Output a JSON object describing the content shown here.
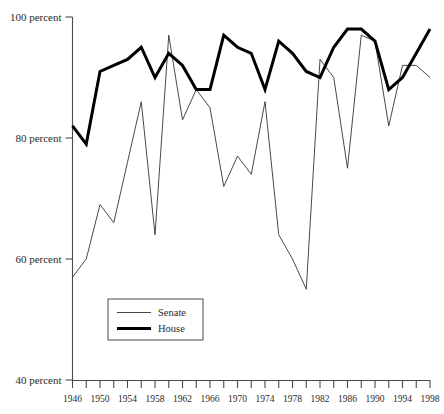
{
  "chart_data": {
    "type": "line",
    "title": "",
    "subtitle": "",
    "xlabel": "",
    "ylabel": "",
    "xlim": [
      1946,
      1998
    ],
    "ylim": [
      40,
      100
    ],
    "grid": false,
    "legend_position": "bottom-left",
    "y_tick_labels": [
      "100 percent",
      "80 percent",
      "60 percent",
      "40 percent"
    ],
    "y_tick_values": [
      100,
      80,
      60,
      40
    ],
    "x_tick_labels": [
      "1946",
      "1950",
      "1954",
      "1958",
      "1962",
      "1966",
      "1970",
      "1974",
      "1978",
      "1982",
      "1986",
      "1990",
      "1994",
      "1998"
    ],
    "x_tick_values": [
      1946,
      1950,
      1954,
      1958,
      1962,
      1966,
      1970,
      1974,
      1978,
      1982,
      1986,
      1990,
      1994,
      1998
    ],
    "x_minor_ticks": [
      1946,
      1948,
      1950,
      1952,
      1954,
      1956,
      1958,
      1960,
      1962,
      1964,
      1966,
      1968,
      1970,
      1972,
      1974,
      1976,
      1978,
      1980,
      1982,
      1984,
      1986,
      1988,
      1990,
      1992,
      1994,
      1996,
      1998
    ],
    "x": [
      1946,
      1948,
      1950,
      1952,
      1954,
      1956,
      1958,
      1960,
      1962,
      1964,
      1966,
      1968,
      1970,
      1972,
      1974,
      1976,
      1978,
      1980,
      1982,
      1984,
      1986,
      1988,
      1990,
      1992,
      1994,
      1996,
      1998
    ],
    "series": [
      {
        "name": "Senate",
        "color": "#333333",
        "line_width": "thin",
        "values": [
          57,
          60,
          69,
          66,
          76,
          86,
          64,
          97,
          83,
          88,
          85,
          72,
          77,
          74,
          86,
          64,
          60,
          55,
          93,
          90,
          75,
          97,
          96,
          82,
          92,
          92,
          90
        ]
      },
      {
        "name": "House",
        "color": "#000000",
        "line_width": "thick",
        "values": [
          82,
          79,
          91,
          92,
          93,
          95,
          90,
          94,
          92,
          88,
          88,
          97,
          95,
          94,
          88,
          96,
          94,
          91,
          90,
          95,
          98,
          98,
          96,
          88,
          90,
          94,
          98
        ]
      }
    ],
    "legend_entries": [
      {
        "label": "Senate",
        "style": "thin-line"
      },
      {
        "label": "House",
        "style": "thick-line"
      }
    ]
  },
  "colors": {
    "background": "#ffffff",
    "axis": "#4a4a4a",
    "senate": "#333333",
    "house": "#000000",
    "text": "#2a2a2a"
  }
}
